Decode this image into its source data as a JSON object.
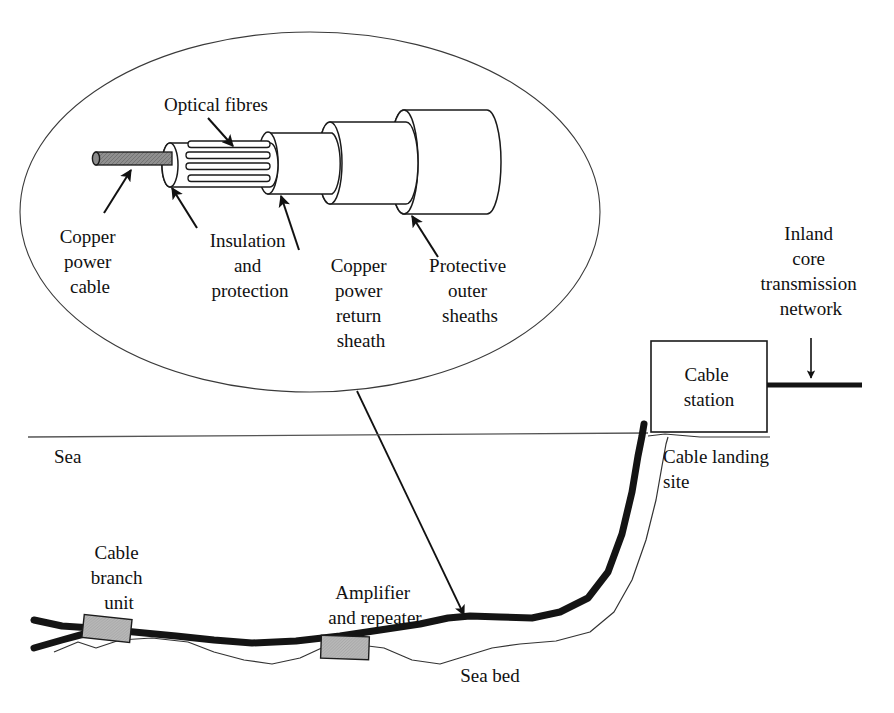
{
  "diagram": {
    "colors": {
      "ink": "#111111",
      "copper_core": "#8a8a8a",
      "device_fill": "#b5b5b5",
      "sea_line": "#555555",
      "seabed_line": "#333333",
      "cable": "#141414",
      "background": "#ffffff"
    }
  },
  "callout": {
    "name": "cable-cutaway-detail",
    "labels": {
      "optical_fibres": "Optical fibres",
      "copper_power_cable": [
        "Copper",
        "power",
        "cable"
      ],
      "insulation_and_protection": [
        "Insulation",
        "and",
        "protection"
      ],
      "copper_power_return_sheath": [
        "Copper",
        "power",
        "return",
        "sheath"
      ],
      "protective_outer_sheaths": [
        "Protective",
        "outer",
        "sheaths"
      ]
    }
  },
  "scene": {
    "labels": {
      "sea": "Sea",
      "sea_bed": "Sea bed",
      "cable_station": [
        "Cable",
        "station"
      ],
      "cable_landing_site": [
        "Cable landing",
        "site"
      ],
      "inland_core_transmission_network": [
        "Inland",
        "core",
        "transmission",
        "network"
      ],
      "cable_branch_unit": [
        "Cable",
        "branch",
        "unit"
      ],
      "amplifier_and_repeater": [
        "Amplifier",
        "and repeater"
      ]
    }
  }
}
